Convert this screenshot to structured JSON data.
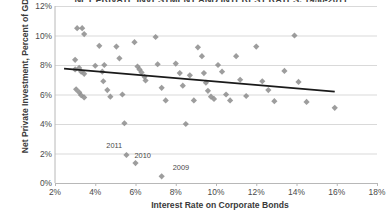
{
  "chart_data": {
    "type": "scatter",
    "title": "NET PRIVATE INVESTMENT AND INTEREST RATES, 1950-2011",
    "xlabel": "Interest Rate on Corporate Bonds",
    "ylabel": "Net Private Investment, Percent of GDP",
    "xlim": [
      2,
      18
    ],
    "ylim": [
      0,
      12
    ],
    "xticks": [
      "2%",
      "4%",
      "6%",
      "8%",
      "10%",
      "12%",
      "14%",
      "16%",
      "18%"
    ],
    "yticks": [
      "0%",
      "2%",
      "4%",
      "6%",
      "8%",
      "10%",
      "12%"
    ],
    "grid": "horizontal",
    "legend": "none",
    "marker": "diamond",
    "marker_color": "#8c8c8c",
    "trendline_color": "#1a1a1a",
    "axis_color": "#b8b8b8",
    "grid_color": "#d9d9d9",
    "trendline": {
      "x0": 2.45,
      "y0": 7.75,
      "x1": 15.9,
      "y1": 6.2
    },
    "points": [
      {
        "x": 3.1,
        "y": 10.5
      },
      {
        "x": 3.35,
        "y": 10.5
      },
      {
        "x": 3.45,
        "y": 10.1
      },
      {
        "x": 3.0,
        "y": 8.35
      },
      {
        "x": 3.2,
        "y": 7.8
      },
      {
        "x": 3.0,
        "y": 7.7
      },
      {
        "x": 3.3,
        "y": 7.55
      },
      {
        "x": 3.45,
        "y": 7.4
      },
      {
        "x": 3.05,
        "y": 6.35
      },
      {
        "x": 3.2,
        "y": 6.15
      },
      {
        "x": 3.3,
        "y": 5.95
      },
      {
        "x": 3.45,
        "y": 5.8
      },
      {
        "x": 4.0,
        "y": 7.95
      },
      {
        "x": 4.2,
        "y": 9.3
      },
      {
        "x": 4.35,
        "y": 7.55
      },
      {
        "x": 4.4,
        "y": 6.9
      },
      {
        "x": 4.45,
        "y": 8.0
      },
      {
        "x": 4.6,
        "y": 6.3
      },
      {
        "x": 4.75,
        "y": 5.85
      },
      {
        "x": 5.05,
        "y": 9.25
      },
      {
        "x": 5.2,
        "y": 8.45
      },
      {
        "x": 5.35,
        "y": 6.0
      },
      {
        "x": 5.45,
        "y": 4.05
      },
      {
        "x": 5.55,
        "y": 1.9
      },
      {
        "x": 5.95,
        "y": 9.55
      },
      {
        "x": 6.1,
        "y": 7.9
      },
      {
        "x": 6.2,
        "y": 7.7
      },
      {
        "x": 6.3,
        "y": 7.5
      },
      {
        "x": 6.45,
        "y": 7.2
      },
      {
        "x": 6.5,
        "y": 6.95
      },
      {
        "x": 6.0,
        "y": 1.35
      },
      {
        "x": 7.0,
        "y": 9.9
      },
      {
        "x": 7.1,
        "y": 8.05
      },
      {
        "x": 7.3,
        "y": 6.45
      },
      {
        "x": 7.5,
        "y": 5.6
      },
      {
        "x": 7.3,
        "y": 0.45
      },
      {
        "x": 8.0,
        "y": 8.1
      },
      {
        "x": 8.2,
        "y": 7.45
      },
      {
        "x": 8.35,
        "y": 6.6
      },
      {
        "x": 8.5,
        "y": 4.0
      },
      {
        "x": 8.7,
        "y": 7.3
      },
      {
        "x": 8.9,
        "y": 5.6
      },
      {
        "x": 9.1,
        "y": 9.2
      },
      {
        "x": 9.3,
        "y": 8.6
      },
      {
        "x": 9.4,
        "y": 7.45
      },
      {
        "x": 9.5,
        "y": 6.8
      },
      {
        "x": 9.6,
        "y": 6.25
      },
      {
        "x": 9.75,
        "y": 5.85
      },
      {
        "x": 9.9,
        "y": 5.7
      },
      {
        "x": 10.1,
        "y": 8.0
      },
      {
        "x": 10.3,
        "y": 7.55
      },
      {
        "x": 10.5,
        "y": 6.0
      },
      {
        "x": 10.7,
        "y": 5.6
      },
      {
        "x": 11.0,
        "y": 8.6
      },
      {
        "x": 11.2,
        "y": 7.0
      },
      {
        "x": 11.5,
        "y": 5.9
      },
      {
        "x": 12.0,
        "y": 9.25
      },
      {
        "x": 12.3,
        "y": 6.9
      },
      {
        "x": 12.6,
        "y": 6.3
      },
      {
        "x": 12.9,
        "y": 5.55
      },
      {
        "x": 13.4,
        "y": 7.6
      },
      {
        "x": 13.9,
        "y": 10.0
      },
      {
        "x": 14.1,
        "y": 6.85
      },
      {
        "x": 14.5,
        "y": 5.5
      },
      {
        "x": 15.9,
        "y": 5.1
      }
    ],
    "annotations": [
      {
        "label": "2011",
        "x": 4.55,
        "y": 2.55
      },
      {
        "label": "2010",
        "x": 5.95,
        "y": 1.9
      },
      {
        "label": "2009",
        "x": 7.85,
        "y": 1.1
      }
    ]
  }
}
